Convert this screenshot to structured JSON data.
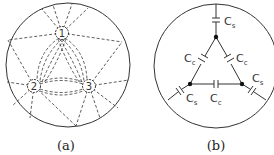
{
  "panel_a": {
    "caption": "(a)",
    "nodes": [
      {
        "id": "1",
        "label": "1",
        "x": 62,
        "y": 33
      },
      {
        "id": "2",
        "label": "2",
        "x": 34,
        "y": 86
      },
      {
        "id": "3",
        "label": "3",
        "x": 89,
        "y": 86
      }
    ],
    "stroke_color": "#333333"
  },
  "panel_b": {
    "caption": "(b)",
    "nodes": [
      {
        "id": "top",
        "x": 216,
        "y": 37
      },
      {
        "id": "left",
        "x": 190,
        "y": 84
      },
      {
        "id": "right",
        "x": 242,
        "y": 84
      }
    ],
    "capacitors": [
      {
        "id": "cs-top",
        "label": "C",
        "sub": "s"
      },
      {
        "id": "cc-left",
        "label": "C",
        "sub": "c"
      },
      {
        "id": "cc-right",
        "label": "C",
        "sub": "c"
      },
      {
        "id": "cc-bottom",
        "label": "C",
        "sub": "c"
      },
      {
        "id": "cs-left",
        "label": "C",
        "sub": "s"
      },
      {
        "id": "cs-right",
        "label": "C",
        "sub": "s"
      }
    ],
    "stroke_color": "#333333"
  }
}
